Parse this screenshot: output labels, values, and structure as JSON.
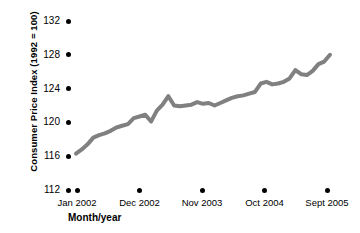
{
  "chart_data": {
    "type": "line",
    "title": "",
    "xlabel": "Month/year",
    "ylabel": "Consumer Price Index (1992 = 100)",
    "ylim": [
      112,
      132
    ],
    "yticks": [
      112,
      116,
      120,
      124,
      128,
      132
    ],
    "ytick_labels": [
      "112",
      "116",
      "120",
      "124",
      "128",
      "132"
    ],
    "xtick_labels": [
      "Jan 2002",
      "Dec 2002",
      "Nov 2003",
      "Oct 2004",
      "Sept 2005"
    ],
    "grid": false,
    "legend": "none",
    "line_color": "#808080",
    "line_width": 4,
    "x_index_range": [
      0,
      44
    ],
    "x": [
      0,
      1,
      2,
      3,
      4,
      5,
      6,
      7,
      8,
      9,
      10,
      11,
      12,
      13,
      14,
      15,
      16,
      17,
      18,
      19,
      20,
      21,
      22,
      23,
      24,
      25,
      26,
      27,
      28,
      29,
      30,
      31,
      32,
      33,
      34,
      35,
      36,
      37,
      38,
      39,
      40,
      41,
      42,
      43,
      44
    ],
    "values": [
      116.3,
      116.8,
      117.4,
      118.2,
      118.5,
      118.7,
      119.0,
      119.4,
      119.6,
      119.8,
      120.5,
      120.7,
      120.9,
      120.1,
      121.4,
      122.1,
      123.1,
      122.0,
      121.9,
      122.0,
      122.1,
      122.4,
      122.2,
      122.3,
      122.0,
      122.3,
      122.6,
      122.9,
      123.1,
      123.2,
      123.4,
      123.6,
      124.6,
      124.8,
      124.5,
      124.6,
      124.8,
      125.2,
      126.2,
      125.7,
      125.6,
      126.1,
      126.9,
      127.2,
      128.0
    ],
    "series": [
      {
        "name": "Consumer Price Index",
        "values": [
          116.3,
          116.8,
          117.4,
          118.2,
          118.5,
          118.7,
          119.0,
          119.4,
          119.6,
          119.8,
          120.5,
          120.7,
          120.9,
          120.1,
          121.4,
          122.1,
          123.1,
          122.0,
          121.9,
          122.0,
          122.1,
          122.4,
          122.2,
          122.3,
          122.0,
          122.3,
          122.6,
          122.9,
          123.1,
          123.2,
          123.4,
          123.6,
          124.6,
          124.8,
          124.5,
          124.6,
          124.8,
          125.2,
          126.2,
          125.7,
          125.6,
          126.1,
          126.9,
          127.2,
          128.0
        ]
      }
    ]
  }
}
